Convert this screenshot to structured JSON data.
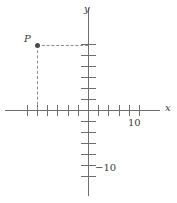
{
  "figure": {
    "width": 177,
    "height": 203,
    "background": "#ffffff",
    "axis_color": "#6e6e6e",
    "dash_color": "#8c8c8c",
    "point_color": "#4a4a4a",
    "text_color": "#3d3d3d"
  },
  "chart_data": {
    "type": "scatter",
    "title": "",
    "xlabel": "x",
    "ylabel": "y",
    "grid": false,
    "legend": null,
    "xlim": [
      -8.1,
      8.6
    ],
    "ylim": [
      -8.6,
      8.6
    ],
    "x_tick_interval": 2,
    "y_tick_interval": 2,
    "x_tick_values": [
      -12,
      -10,
      -8,
      -6,
      -4,
      -2,
      2,
      4,
      6,
      8,
      10
    ],
    "y_tick_values": [
      12,
      10,
      8,
      6,
      4,
      2,
      -2,
      -4,
      -6,
      -8,
      -10,
      -12
    ],
    "tick_labels": [
      {
        "name": "x-tick-label-10",
        "text": "10",
        "value": 10,
        "axis": "x",
        "left": 128,
        "top": 118
      },
      {
        "name": "y-tick-label-neg10",
        "text": "−10",
        "value": -10,
        "axis": "y",
        "left": 95,
        "top": 163
      }
    ],
    "axis_labels": [
      {
        "name": "x-axis-label",
        "text": "x",
        "left": 165,
        "top": 103
      },
      {
        "name": "y-axis-label",
        "text": "y",
        "left": 84,
        "top": 4
      }
    ],
    "points": [
      {
        "name": "point-P",
        "label": "P",
        "x": -5,
        "y": 6,
        "px_x": 37,
        "px_y": 45,
        "label_left": 24,
        "label_top": 34,
        "guides": [
          "horizontal-to-y-axis",
          "vertical-to-x-axis"
        ]
      }
    ],
    "annotations": [
      {
        "name": "dashed-guide-horizontal",
        "from": [
          -5,
          6
        ],
        "to": [
          0,
          6
        ]
      },
      {
        "name": "dashed-guide-vertical",
        "from": [
          -5,
          6
        ],
        "to": [
          -5,
          0
        ]
      }
    ]
  },
  "geometry": {
    "origin_px": [
      88,
      110
    ],
    "x_axis": {
      "start_px": 5,
      "end_px": 160,
      "y_px": 110
    },
    "y_axis": {
      "start_px": 8,
      "end_px": 196,
      "x_px": 88
    },
    "x_tick_spacing_px": 10.2,
    "y_tick_spacing_px": 11.0,
    "x_tick_half_len_px": 5,
    "y_tick_half_len_px": 7
  }
}
